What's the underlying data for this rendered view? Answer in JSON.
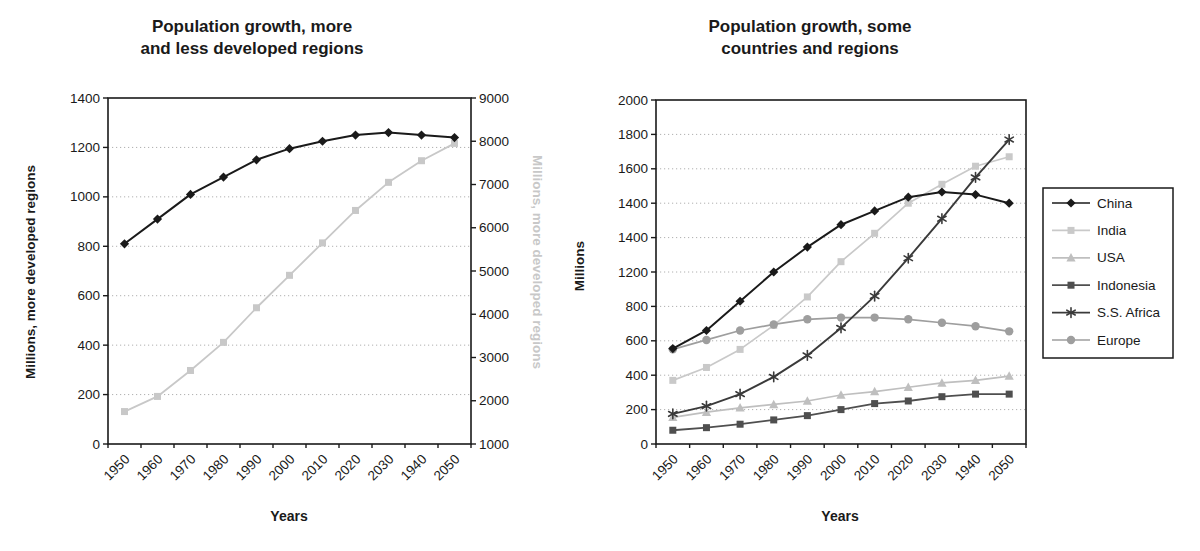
{
  "chart_data": [
    {
      "type": "line",
      "title": "Population growth, more\nand less developed regions",
      "xlabel": "Years",
      "x_categories": [
        "1950",
        "1960",
        "1970",
        "1980",
        "1990",
        "2000",
        "2010",
        "2020",
        "2030",
        "1940",
        "2050"
      ],
      "grid": true,
      "left_axis": {
        "label": "Millions, more developed regions",
        "min": 0,
        "max": 1400,
        "step": 200,
        "tick_labels": [
          "1400",
          "1200",
          "1000",
          "800",
          "600",
          "400",
          "200",
          "0"
        ]
      },
      "right_axis": {
        "label": "Millions, more developed regions",
        "min": 1000,
        "max": 9000,
        "step": 1000,
        "tick_labels": [
          "9000",
          "8000",
          "7000",
          "6000",
          "5000",
          "4000",
          "3000",
          "2000",
          "1000"
        ]
      },
      "series": [
        {
          "name": "More developed regions",
          "axis": "left",
          "marker": "diamond",
          "color": "#1a1a1a",
          "values": [
            810,
            910,
            1010,
            1080,
            1150,
            1195,
            1225,
            1250,
            1260,
            1250,
            1240
          ]
        },
        {
          "name": "Less developed regions",
          "axis": "right",
          "marker": "square",
          "color": "#c8c8c8",
          "values": [
            1750,
            2100,
            2700,
            3350,
            4150,
            4900,
            5650,
            6400,
            7050,
            7550,
            7950
          ]
        }
      ]
    },
    {
      "type": "line",
      "title": "Population growth, some\ncountries and regions",
      "xlabel": "Years",
      "x_categories": [
        "1950",
        "1960",
        "1970",
        "1980",
        "1990",
        "2000",
        "2010",
        "2020",
        "2030",
        "1940",
        "2050"
      ],
      "grid": true,
      "y_axis": {
        "label": "Millions",
        "min": 0,
        "max": 2000,
        "step": 200,
        "tick_labels": [
          "2000",
          "1800",
          "1600",
          "1400",
          "1400",
          "1200",
          "800",
          "600",
          "400",
          "200",
          "0"
        ]
      },
      "legend": {
        "position": "right",
        "entries": [
          "China",
          "India",
          "USA",
          "Indonesia",
          "S.S. Africa",
          "Europe"
        ]
      },
      "series": [
        {
          "name": "China",
          "marker": "diamond",
          "color": "#1a1a1a",
          "values": [
            555,
            660,
            830,
            1000,
            1145,
            1275,
            1355,
            1435,
            1465,
            1450,
            1400
          ]
        },
        {
          "name": "India",
          "marker": "square",
          "color": "#c9c9c9",
          "values": [
            370,
            445,
            550,
            690,
            855,
            1060,
            1225,
            1400,
            1510,
            1615,
            1670
          ]
        },
        {
          "name": "USA",
          "marker": "triangle",
          "color": "#bfbfbf",
          "values": [
            155,
            185,
            210,
            230,
            250,
            285,
            305,
            330,
            355,
            370,
            395
          ]
        },
        {
          "name": "Indonesia",
          "marker": "square",
          "color": "#4f4f4f",
          "values": [
            80,
            95,
            115,
            140,
            165,
            200,
            235,
            250,
            275,
            290,
            290
          ]
        },
        {
          "name": "S.S. Africa",
          "marker": "asterisk",
          "color": "#3a3a3a",
          "values": [
            175,
            220,
            290,
            390,
            515,
            675,
            860,
            1080,
            1310,
            1550,
            1770
          ]
        },
        {
          "name": "Europe",
          "marker": "circle",
          "color": "#9e9e9e",
          "values": [
            550,
            605,
            660,
            695,
            725,
            735,
            735,
            725,
            705,
            685,
            655
          ]
        }
      ]
    }
  ],
  "colors": {
    "background": "#ffffff",
    "axis": "#1a1a1a",
    "grid": "#b0b0b0",
    "muted_axis_label": "#c8c8c8"
  }
}
